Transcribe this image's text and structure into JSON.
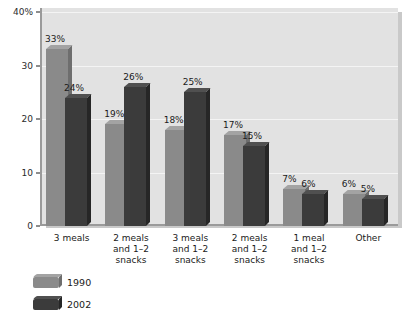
{
  "chart_data": {
    "type": "bar",
    "title": "",
    "subtitle": "",
    "xlabel": "",
    "ylabel": "",
    "ylim": [
      0,
      40
    ],
    "yticks": [
      0,
      10,
      20,
      30,
      40
    ],
    "ytick_labels": [
      "0",
      "10",
      "20",
      "30",
      "40%"
    ],
    "grid": true,
    "legend_position": "bottom-left",
    "categories": [
      "3 meals",
      "2 meals and 1-2 snacks",
      "3 meals and 1-2 snacks",
      "2 meals and 1-2 snacks",
      "1 meal and 1-2 snacks",
      "Other"
    ],
    "category_lines": [
      [
        "3 meals"
      ],
      [
        "2 meals",
        "and 1–2",
        "snacks"
      ],
      [
        "3 meals",
        "and 1–2",
        "snacks"
      ],
      [
        "2 meals",
        "and 1–2",
        "snacks"
      ],
      [
        "1 meal",
        "and 1–2",
        "snacks"
      ],
      [
        "Other"
      ]
    ],
    "series": [
      {
        "name": "1990",
        "color": "#8a8a8a",
        "values": [
          33,
          19,
          18,
          17,
          7,
          6
        ],
        "value_labels": [
          "33%",
          "19%",
          "18%",
          "17%",
          "7%",
          "6%"
        ]
      },
      {
        "name": "2002",
        "color": "#3b3b3b",
        "values": [
          24,
          26,
          25,
          15,
          6,
          5
        ],
        "value_labels": [
          "24%",
          "26%",
          "25%",
          "15%",
          "6%",
          "5%"
        ]
      }
    ]
  },
  "legend": {
    "items": [
      {
        "label": "1990",
        "swatch": "legend-swatch-1990"
      },
      {
        "label": "2002",
        "swatch": "legend-swatch-2002"
      }
    ]
  },
  "colors": {
    "plot_background": "#e2e2e2",
    "gridline": "#f4f4f4",
    "axis": "#9a9a9a",
    "shadow": "#c9c9c9",
    "series_1990": "#8a8a8a",
    "series_2002": "#3b3b3b",
    "text": "#1a1a1a",
    "page_background": "#ffffff"
  }
}
